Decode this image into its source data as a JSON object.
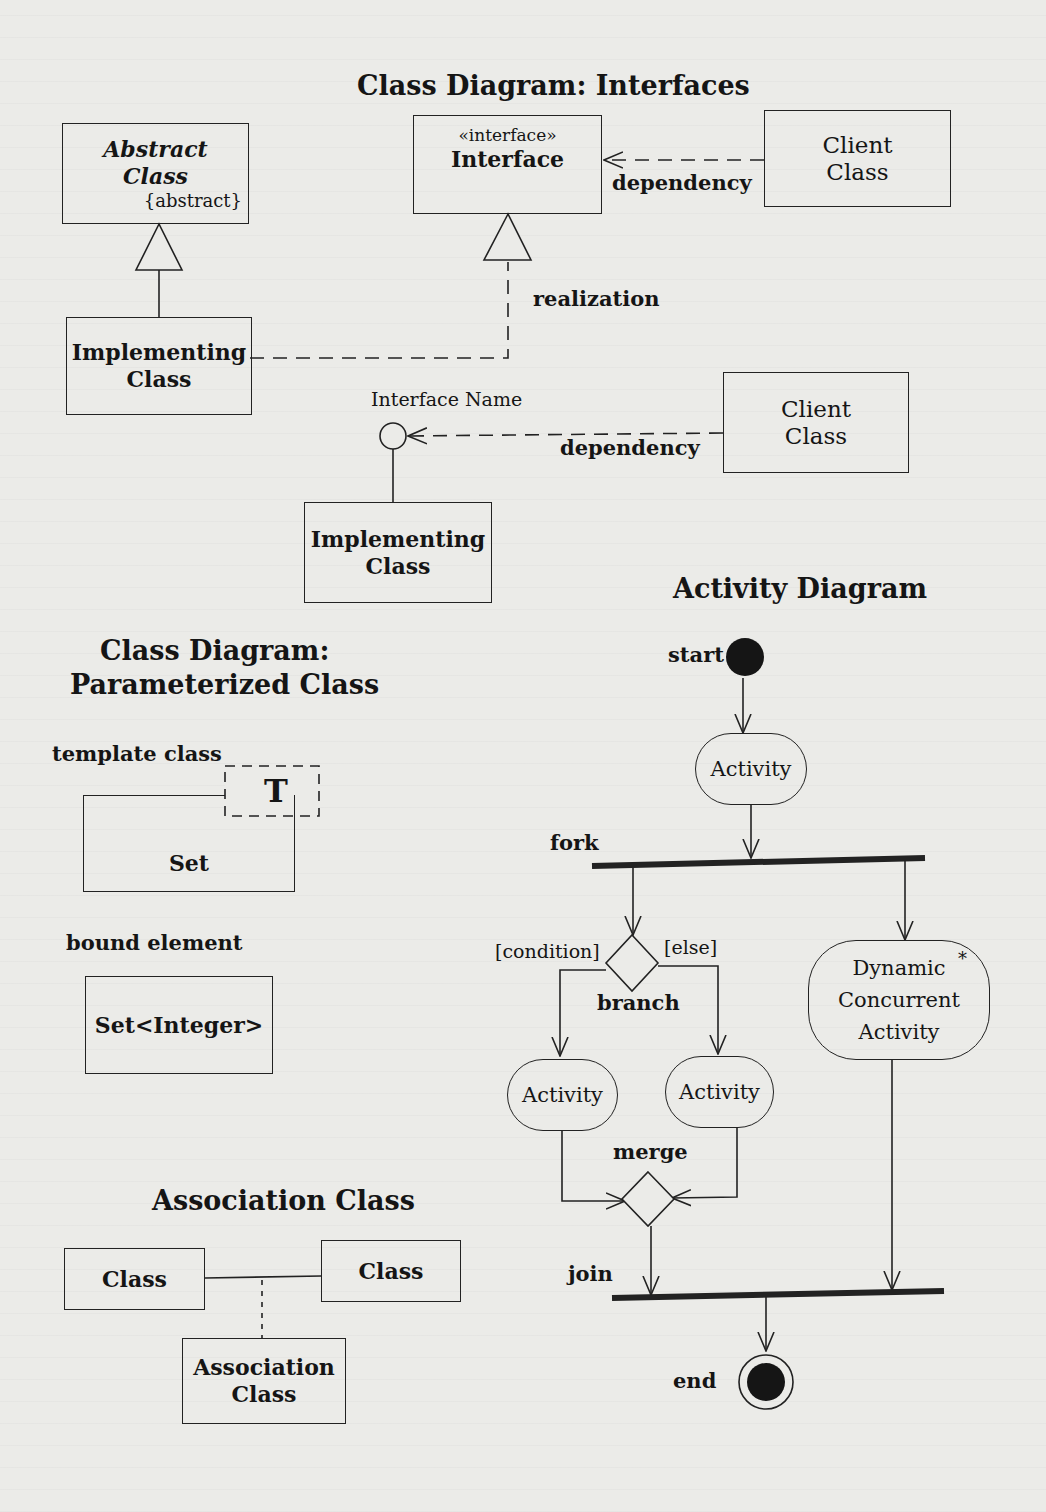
{
  "sections": {
    "interfaces_title": "Class Diagram: Interfaces",
    "parameterized_title_line1": "Class Diagram:",
    "parameterized_title_line2": "Parameterized Class",
    "association_title": "Association Class",
    "activity_title": "Activity Diagram"
  },
  "interfaces": {
    "abstract_class": {
      "line1": "Abstract",
      "line2": "Class",
      "constraint": "{abstract}"
    },
    "interface_box": {
      "stereotype": "«interface»",
      "name": "Interface"
    },
    "client_class_top": {
      "line1": "Client",
      "line2": "Class"
    },
    "dependency_top_label": "dependency",
    "realization_label": "realization",
    "implementing_class_top": {
      "line1": "Implementing",
      "line2": "Class"
    },
    "lollipop_label": "Interface Name",
    "client_class_bottom": {
      "line1": "Client",
      "line2": "Class"
    },
    "dependency_bottom_label": "dependency",
    "implementing_class_bottom": {
      "line1": "Implementing",
      "line2": "Class"
    }
  },
  "parameterized": {
    "template_label": "template class",
    "template_param": "T",
    "template_class_name": "Set",
    "bound_label": "bound element",
    "bound_class_name": "Set<Integer>"
  },
  "association": {
    "left_class": "Class",
    "right_class": "Class",
    "assoc_class_line1": "Association",
    "assoc_class_line2": "Class"
  },
  "activity": {
    "start_label": "start",
    "activity_top": "Activity",
    "fork_label": "fork",
    "guard_condition": "[condition]",
    "guard_else": "[else]",
    "branch_label": "branch",
    "activity_left": "Activity",
    "activity_right": "Activity",
    "dynamic_line1": "Dynamic",
    "dynamic_line2": "Concurrent",
    "dynamic_line3": "Activity",
    "dynamic_multiplicity": "*",
    "merge_label": "merge",
    "join_label": "join",
    "end_label": "end"
  },
  "colors": {
    "ink": "#151515",
    "paper": "#ebebe8"
  }
}
